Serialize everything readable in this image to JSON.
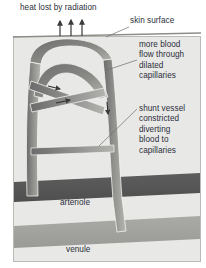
{
  "figure": {
    "panel": {
      "background_color": "#e8e8e6",
      "border_color": "#b9b9b5"
    }
  },
  "labels": {
    "heat": "heat lost by radiation",
    "skin_surface": "skin surface",
    "dilated_capillaries": "more blood\nflow through\ndilated\ncapillaries",
    "shunt_vessel": "shunt vessel\nconstricted\ndiverting\nblood to\ncapillaries",
    "arteriole": "arteriole",
    "venule": "venule"
  },
  "colors": {
    "text": "#2b2f3a",
    "skin_line": "#8d8d88",
    "panel_fill": "#e8e8e6",
    "arteriole_band": "#5a5a5a",
    "venule_band": "#a3a3a0",
    "vessel_dark": "#6e6e6e",
    "vessel_light": "#b0b0ad",
    "leader_line": "#6f6f6c",
    "arrow": "#3a3a3a"
  },
  "elements": {
    "heat_arrows_count": 3,
    "capillary_loops": 2,
    "flow_arrows_count": 3,
    "shunt_state": "constricted",
    "capillary_state": "dilated"
  }
}
